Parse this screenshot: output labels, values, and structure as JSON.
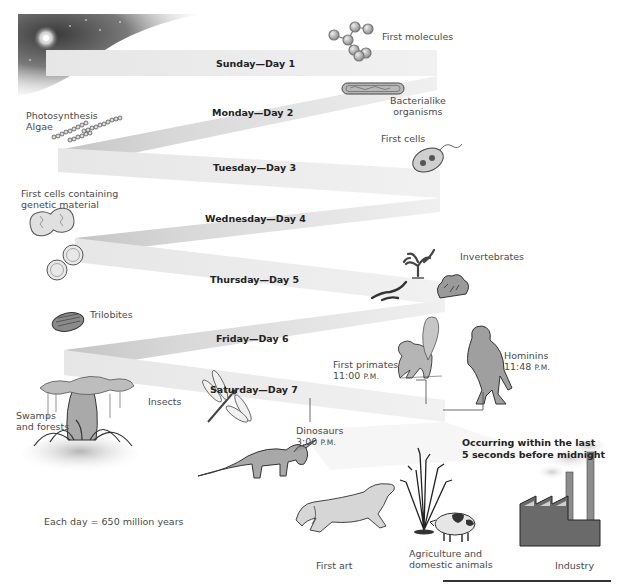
{
  "figure": {
    "days": [
      {
        "label": "Sunday—Day 1"
      },
      {
        "label": "Monday—Day 2"
      },
      {
        "label": "Tuesday—Day 3"
      },
      {
        "label": "Wednesday—Day 4"
      },
      {
        "label": "Thursday—Day 5"
      },
      {
        "label": "Friday—Day 6"
      },
      {
        "label": "Saturday—Day 7"
      }
    ],
    "events": {
      "first_molecules": "First molecules",
      "bacterialike_1": "Bacterialike",
      "bacterialike_2": "organisms",
      "photosynthesis_1": "Photosynthesis",
      "photosynthesis_2": "Algae",
      "first_cells": "First cells",
      "genetic_1": "First cells containing",
      "genetic_2": "genetic material",
      "invertebrates": "Invertebrates",
      "trilobites": "Trilobites",
      "first_primates": "First primates",
      "first_primates_time": "11:00",
      "first_primates_ampm": "P.M.",
      "hominins": "Hominins",
      "hominins_time": "11:48",
      "hominins_ampm": "P.M.",
      "swamps_1": "Swamps",
      "swamps_2": "and forests",
      "insects": "Insects",
      "dinosaurs": "Dinosaurs",
      "dinosaurs_time": "3:00",
      "dinosaurs_ampm": "P.M.",
      "first_art": "First art",
      "agriculture_1": "Agriculture and",
      "agriculture_2": "domestic animals",
      "industry": "Industry"
    },
    "callout_1": "Occurring within the last",
    "callout_2": "5 seconds before midnight",
    "scale_note": "Each day = 650 million years",
    "colors": {
      "ribbon_light": "#ececec",
      "ribbon_mid": "#d9d9d9",
      "ribbon_dark": "#bdbdbd",
      "text": "#4a4a4a",
      "bold_text": "#222222"
    }
  }
}
